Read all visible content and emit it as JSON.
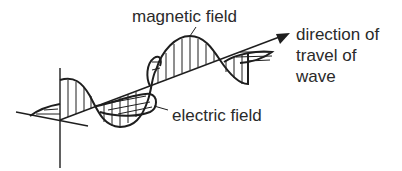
{
  "diagram": {
    "type": "electromagnetic-wave",
    "labels": {
      "magnetic_field": "magnetic field",
      "electric_field": "electric field",
      "direction_line1": "direction of",
      "direction_line2": "travel of",
      "direction_line3": "wave"
    },
    "colors": {
      "line": "#1e1e1e",
      "text": "#2a2a2a",
      "background": "#ffffff"
    }
  }
}
